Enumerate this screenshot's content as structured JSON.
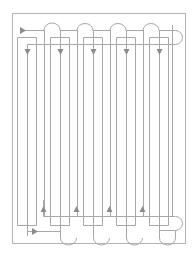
{
  "diagram": {
    "type": "serpentine-pipe-layout",
    "colors": {
      "frame": "#b4b4b4",
      "pipe": "#a8a8a8",
      "arrow": "#8c8c8c",
      "background": "#ffffff"
    },
    "frame": {
      "x": 12.5,
      "y": 13,
      "w": 173,
      "h": 230
    },
    "columns": 5,
    "column_pitch": 33,
    "down_arrows_x": [
      27,
      60,
      93,
      126,
      159
    ],
    "up_arrows_x": [
      43,
      76,
      109,
      142
    ],
    "inlet_arrow": {
      "x": 22,
      "y": 30,
      "direction": "right"
    },
    "outlet_arrow": {
      "x": 34,
      "y": 231,
      "direction": "right"
    }
  }
}
